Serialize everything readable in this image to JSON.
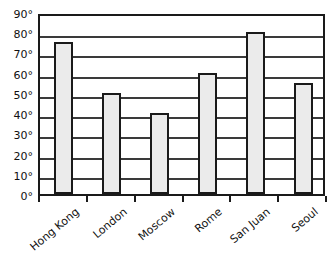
{
  "chart_data": {
    "type": "bar",
    "title": "",
    "xlabel": "",
    "ylabel": "",
    "categories": [
      "Hong Kong",
      "London",
      "Moscow",
      "Rome",
      "San Juan",
      "Seoul"
    ],
    "values": [
      75,
      50,
      40,
      60,
      80,
      55
    ],
    "ylim": [
      0,
      90
    ],
    "ytick_step": 10,
    "ytick_labels": [
      "0°",
      "10°",
      "20°",
      "30°",
      "40°",
      "50°",
      "60°",
      "70°",
      "80°",
      "90°"
    ],
    "ytick_values": [
      0,
      10,
      20,
      30,
      40,
      50,
      60,
      70,
      80,
      90
    ],
    "grid": true,
    "legend": false,
    "unit_suffix": "°",
    "bar_fill_color": "#ebebeb",
    "bar_border_color": "#1a1a1a",
    "axis_color": "#1a1a1a",
    "gridline_color": "#3a3a3a",
    "background_color": "#ffffff",
    "xtick_label_rotation": -40
  }
}
